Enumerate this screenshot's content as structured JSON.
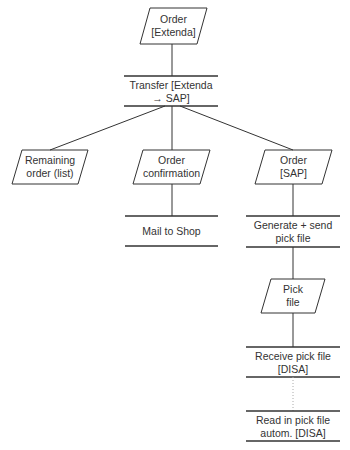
{
  "diagram": {
    "colors": {
      "stroke": "#333333",
      "text": "#333333",
      "background": "#ffffff",
      "dotted": "#aaaaaa"
    },
    "nodes": [
      {
        "id": "order-extenda",
        "type": "data",
        "lines": [
          "Order",
          "[Extenda]"
        ]
      },
      {
        "id": "transfer",
        "type": "process",
        "lines": [
          "Transfer [Extenda",
          "→ SAP]"
        ]
      },
      {
        "id": "remaining-order",
        "type": "data",
        "lines": [
          "Remaining",
          "order (list)"
        ]
      },
      {
        "id": "order-confirmation",
        "type": "data",
        "lines": [
          "Order",
          "confirmation"
        ]
      },
      {
        "id": "order-sap",
        "type": "data",
        "lines": [
          "Order",
          "[SAP]"
        ]
      },
      {
        "id": "mail-to-shop",
        "type": "process",
        "lines": [
          "Mail to Shop"
        ]
      },
      {
        "id": "generate-send",
        "type": "process",
        "lines": [
          "Generate + send",
          "pick file"
        ]
      },
      {
        "id": "pick-file",
        "type": "data",
        "lines": [
          "Pick",
          "file"
        ]
      },
      {
        "id": "receive-pick-file",
        "type": "process",
        "lines": [
          "Receive pick file",
          "[DISA]"
        ]
      },
      {
        "id": "read-in-pick-file",
        "type": "process",
        "lines": [
          "Read in pick file",
          "autom. [DISA]"
        ]
      }
    ],
    "edges": [
      {
        "from": "order-extenda",
        "to": "transfer",
        "style": "solid"
      },
      {
        "from": "transfer",
        "to": "remaining-order",
        "style": "solid"
      },
      {
        "from": "transfer",
        "to": "order-confirmation",
        "style": "solid"
      },
      {
        "from": "transfer",
        "to": "order-sap",
        "style": "solid"
      },
      {
        "from": "order-confirmation",
        "to": "mail-to-shop",
        "style": "solid"
      },
      {
        "from": "order-sap",
        "to": "generate-send",
        "style": "solid"
      },
      {
        "from": "generate-send",
        "to": "pick-file",
        "style": "solid"
      },
      {
        "from": "pick-file",
        "to": "receive-pick-file",
        "style": "solid"
      },
      {
        "from": "receive-pick-file",
        "to": "read-in-pick-file",
        "style": "dotted"
      }
    ]
  }
}
